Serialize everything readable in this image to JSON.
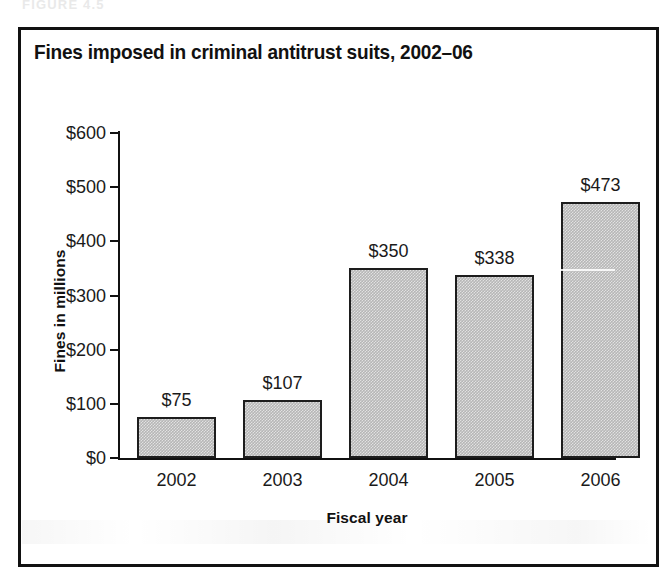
{
  "figure": {
    "caption": "FIGURE 4.5",
    "title": "Fines imposed in criminal antitrust suits, 2002–06",
    "frame_color": "#111111",
    "background": "#ffffff"
  },
  "axes": {
    "y_title": "Fines in millions",
    "x_title": "Fiscal year",
    "y_ticks": [
      "$600",
      "$500",
      "$400",
      "$300",
      "$200",
      "$100",
      "$0"
    ],
    "x_ticks": [
      "2002",
      "2003",
      "2004",
      "2005",
      "2006"
    ]
  },
  "bars": [
    {
      "year": "2002",
      "label": "$75",
      "value": 75
    },
    {
      "year": "2003",
      "label": "$107",
      "value": 107
    },
    {
      "year": "2004",
      "label": "$350",
      "value": 350
    },
    {
      "year": "2005",
      "label": "$338",
      "value": 338
    },
    {
      "year": "2006",
      "label": "$473",
      "value": 473
    }
  ],
  "chart_data": {
    "type": "bar",
    "title": "Fines imposed in criminal antitrust suits, 2002–06",
    "xlabel": "Fiscal year",
    "ylabel": "Fines in millions",
    "categories": [
      "2002",
      "2003",
      "2004",
      "2005",
      "2006"
    ],
    "values": [
      75,
      107,
      350,
      338,
      473
    ],
    "data_labels": [
      "$75",
      "$107",
      "$350",
      "$338",
      "$473"
    ],
    "ytick_labels": [
      "$0",
      "$100",
      "$200",
      "$300",
      "$400",
      "$500",
      "$600"
    ],
    "ytick_values": [
      0,
      100,
      200,
      300,
      400,
      500,
      600
    ],
    "ylim": [
      0,
      600
    ],
    "grid": false,
    "legend": false,
    "bar_fill_color": "#b6b6b6",
    "bar_edge_color": "#1d1d1d",
    "units": "millions of US dollars"
  }
}
